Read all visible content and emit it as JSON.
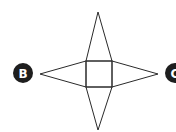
{
  "diagram": {
    "type": "net-of-square-pyramid",
    "labels": [
      {
        "id": "B",
        "text": "B",
        "side": "left"
      },
      {
        "id": "C",
        "text": "C",
        "side": "right"
      }
    ],
    "colors": {
      "stroke": "#2a2a2a",
      "label_fill": "#1e1e1e",
      "label_text": "#ffffff",
      "background": "#ffffff"
    }
  }
}
